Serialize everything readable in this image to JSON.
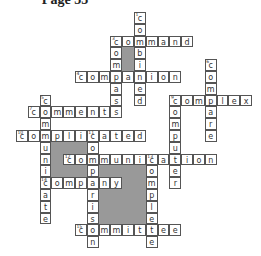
{
  "title": "Page 35",
  "grid": {
    "origin_x": 16,
    "origin_y": 12,
    "cell": 11.8
  },
  "shaded": [
    [
      9,
      3,
      1,
      2
    ],
    [
      3,
      11,
      3,
      1
    ],
    [
      3,
      12,
      1,
      1
    ],
    [
      3,
      13,
      3,
      1
    ],
    [
      7,
      13,
      4,
      5
    ]
  ],
  "words": [
    {
      "num": 1,
      "dir": "down",
      "col": 10,
      "row": 0,
      "answer": "combined"
    },
    {
      "num": 2,
      "dir": "across",
      "col": 8,
      "row": 2,
      "answer": "command"
    },
    {
      "num": 3,
      "dir": "down",
      "col": 8,
      "row": 2,
      "answer": "compass"
    },
    {
      "num": 4,
      "dir": "across",
      "col": 5,
      "row": 5,
      "answer": "companion"
    },
    {
      "num": 5,
      "dir": "down",
      "col": 2,
      "row": 7,
      "answer": "communicate"
    },
    {
      "num": 6,
      "dir": "down",
      "col": 16,
      "row": 4,
      "answer": "compare"
    },
    {
      "num": 7,
      "dir": "across",
      "col": 1,
      "row": 8,
      "answer": "comments"
    },
    {
      "num": 8,
      "dir": "across",
      "col": 13,
      "row": 7,
      "answer": "complex"
    },
    {
      "num": 9,
      "dir": "down",
      "col": 13,
      "row": 7,
      "answer": "computer"
    },
    {
      "num": 10,
      "dir": "across",
      "col": 0,
      "row": 10,
      "answer": "complicated"
    },
    {
      "num": 11,
      "dir": "down",
      "col": 6,
      "row": 10,
      "answer": "comparison"
    },
    {
      "num": 12,
      "dir": "across",
      "col": 4,
      "row": 12,
      "answer": "communication"
    },
    {
      "num": 13,
      "dir": "down",
      "col": 11,
      "row": 12,
      "answer": "complete"
    },
    {
      "num": 14,
      "dir": "across",
      "col": 2,
      "row": 14,
      "answer": "company"
    },
    {
      "num": 15,
      "dir": "across",
      "col": 5,
      "row": 18,
      "answer": "committee"
    }
  ]
}
